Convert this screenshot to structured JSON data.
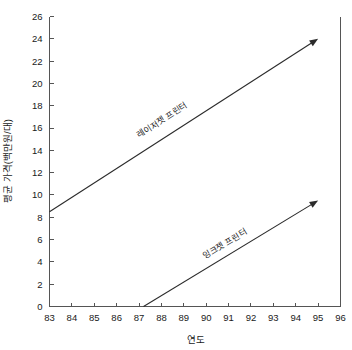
{
  "chart_data": {
    "type": "line",
    "title": "",
    "xlabel": "연도",
    "ylabel": "평균 가격(백만원/대)",
    "xlim": [
      83,
      96
    ],
    "ylim": [
      0,
      26
    ],
    "xticks": [
      83,
      84,
      85,
      86,
      87,
      88,
      89,
      90,
      91,
      92,
      93,
      94,
      95,
      96
    ],
    "yticks": [
      0,
      2,
      4,
      6,
      8,
      10,
      12,
      14,
      16,
      18,
      20,
      22,
      24,
      26
    ],
    "grid": false,
    "legend_position": "inline-annotation",
    "series": [
      {
        "name": "레이저젯 프린터",
        "label": "레이저젯 프린터",
        "arrow_end": true,
        "x": [
          83,
          95
        ],
        "values": [
          8.5,
          24.0
        ],
        "annotation_x": 88.1,
        "annotation_y": 16.5
      },
      {
        "name": "잉크젯 프린터",
        "label": "잉크젯 프린터",
        "arrow_end": true,
        "x": [
          87.2,
          95
        ],
        "values": [
          0.0,
          9.5
        ],
        "annotation_x": 90.9,
        "annotation_y": 5.4
      }
    ]
  },
  "axes": {
    "x_title": "연도",
    "y_title": "평균 가격(백만원/대)"
  },
  "ticks": {
    "x": [
      "83",
      "84",
      "85",
      "86",
      "87",
      "88",
      "89",
      "90",
      "91",
      "92",
      "93",
      "94",
      "95",
      "96"
    ],
    "y": [
      "0",
      "2",
      "4",
      "6",
      "8",
      "10",
      "12",
      "14",
      "16",
      "18",
      "20",
      "22",
      "24",
      "26"
    ]
  },
  "labels": {
    "laser": "레이저젯 프린터",
    "inkjet": "잉크젯 프린터"
  },
  "colors": {
    "line": "#2b2b2b",
    "axis": "#555555",
    "text": "#1a1a1a",
    "background": "#ffffff"
  }
}
